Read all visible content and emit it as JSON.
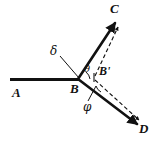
{
  "figure": {
    "type": "geometry-diagram",
    "background_color": "#ffffff",
    "stroke_color": "#111111",
    "width": 155,
    "height": 142,
    "points": [
      {
        "id": "A",
        "label": "A",
        "x": 16,
        "y": 94,
        "label_x": 14,
        "label_y": 86
      },
      {
        "id": "B",
        "label": "B",
        "x": 78,
        "y": 79,
        "label_x": 71,
        "label_y": 82
      },
      {
        "id": "Bprime",
        "label": "B'",
        "x": 101,
        "y": 76,
        "label_x": 101,
        "label_y": 68
      },
      {
        "id": "C",
        "label": "C",
        "x": 114,
        "y": 24,
        "label_x": 111,
        "label_y": 4
      },
      {
        "id": "D",
        "label": "D",
        "x": 136,
        "y": 124,
        "label_x": 138,
        "label_y": 124
      }
    ],
    "angles": [
      {
        "id": "theta",
        "label": "θ",
        "label_x": 83,
        "label_y": 70,
        "between": "BA-extension and BC"
      },
      {
        "id": "phi",
        "label": "φ",
        "label_x": 85,
        "label_y": 105,
        "between": "BD and B'D"
      },
      {
        "id": "delta",
        "label": "δ",
        "label_x": 52,
        "label_y": 51,
        "between": "AB and BC"
      }
    ],
    "segments": [
      {
        "id": "ray-A-B",
        "style": "solid",
        "weight": "heavy",
        "from": "A",
        "to": "B"
      },
      {
        "id": "ray-B-C",
        "style": "solid",
        "weight": "heavy",
        "from": "B",
        "to": "C",
        "arrow": true
      },
      {
        "id": "ray-B-D",
        "style": "solid",
        "weight": "heavy",
        "from": "B",
        "to": "D",
        "arrow": true
      },
      {
        "id": "ray-Bprime-C",
        "style": "dashed",
        "weight": "light",
        "from": "Bprime",
        "to": "C",
        "arrow": true
      },
      {
        "id": "ray-Bprime-D",
        "style": "dashed",
        "weight": "light",
        "from": "Bprime",
        "to": "D",
        "arrow": true
      },
      {
        "id": "leader-delta",
        "style": "solid",
        "weight": "light",
        "from": "delta-label",
        "to": "B"
      },
      {
        "id": "leader-phi",
        "style": "solid",
        "weight": "light",
        "from": "phi-label",
        "to": "phi-arc"
      }
    ]
  }
}
